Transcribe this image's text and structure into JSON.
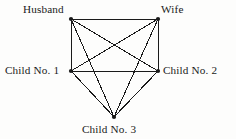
{
  "diagram": {
    "type": "complete-graph",
    "background_color": "#fdfdfc",
    "line_color": "#1a1a1a",
    "text_color": "#1a1a1a",
    "nodes": [
      {
        "id": "husband",
        "label": "Husband",
        "x": 71,
        "y": 19
      },
      {
        "id": "wife",
        "label": "Wife",
        "x": 158,
        "y": 19
      },
      {
        "id": "child1",
        "label": "Child No. 1",
        "x": 71,
        "y": 71
      },
      {
        "id": "child2",
        "label": "Child No. 2",
        "x": 158,
        "y": 71
      },
      {
        "id": "child3",
        "label": "Child No. 3",
        "x": 114,
        "y": 117
      }
    ],
    "edges": [
      {
        "from": "husband",
        "to": "wife"
      },
      {
        "from": "husband",
        "to": "child1"
      },
      {
        "from": "husband",
        "to": "child2"
      },
      {
        "from": "husband",
        "to": "child3"
      },
      {
        "from": "wife",
        "to": "child1"
      },
      {
        "from": "wife",
        "to": "child2"
      },
      {
        "from": "wife",
        "to": "child3"
      },
      {
        "from": "child1",
        "to": "child2"
      },
      {
        "from": "child1",
        "to": "child3"
      },
      {
        "from": "child2",
        "to": "child3"
      }
    ]
  }
}
